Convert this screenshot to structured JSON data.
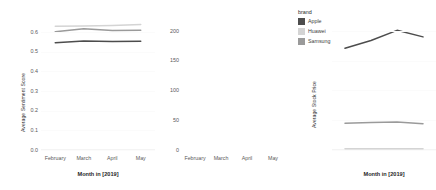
{
  "chart_data": [
    {
      "type": "line",
      "panel": "left",
      "title": "",
      "xlabel": "Month in [2019]",
      "ylabel": "Average Sentiment Score",
      "categories": [
        "February",
        "March",
        "April",
        "May"
      ],
      "yticks": [
        "0.0",
        "0.1",
        "0.2",
        "0.3",
        "0.4",
        "0.5",
        "0.6"
      ],
      "ylim": [
        0.0,
        0.65
      ],
      "grid": false,
      "legend_position": "right",
      "series": [
        {
          "name": "Apple",
          "values": [
            0.545,
            0.553,
            0.551,
            0.552
          ]
        },
        {
          "name": "Huawei",
          "values": [
            0.628,
            0.63,
            0.632,
            0.637
          ]
        },
        {
          "name": "Samsung",
          "values": [
            0.6,
            0.616,
            0.607,
            0.608
          ]
        }
      ]
    },
    {
      "type": "line",
      "panel": "right",
      "title": "",
      "xlabel": "Month in [2019]",
      "ylabel": "Average Stock Price",
      "categories": [
        "February",
        "March",
        "April",
        "May"
      ],
      "yticks": [
        "0",
        "50",
        "100",
        "150",
        "200"
      ],
      "ylim": [
        0,
        215
      ],
      "grid": false,
      "legend_position": "right",
      "series": [
        {
          "name": "Apple",
          "values": [
            171,
            184,
            201,
            190
          ]
        },
        {
          "name": "Huawei",
          "values": [
            2,
            2,
            2,
            2
          ]
        },
        {
          "name": "Samsung",
          "values": [
            45,
            46,
            47,
            44
          ]
        }
      ]
    }
  ],
  "legend": {
    "title": "brand",
    "entries": [
      {
        "label": "Apple",
        "color": "#4d4d4d"
      },
      {
        "label": "Huawei",
        "color": "#d4d4d4"
      },
      {
        "label": "Samsung",
        "color": "#9a9a9a"
      }
    ]
  },
  "colors": {
    "apple": "#4d4d4d",
    "huawei": "#d4d4d4",
    "samsung": "#9a9a9a",
    "axis_text": "#5a5a5a",
    "title_text": "#1f1f1f",
    "panel_background": "#ffffff",
    "gridline": "#fbfbfb"
  }
}
